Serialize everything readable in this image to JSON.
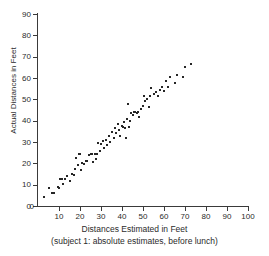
{
  "chart_data": {
    "type": "scatter",
    "title": "",
    "xlabel": "Distances Estimated in Feet",
    "xlabel_sub": "(subject 1: absolute estimates, before lunch)",
    "ylabel": "Actual Distances in Feet",
    "xlim": [
      0,
      100
    ],
    "ylim": [
      0,
      90
    ],
    "xticks": [
      0,
      10,
      20,
      30,
      40,
      50,
      60,
      70,
      80,
      90,
      100
    ],
    "yticks": [
      0,
      10,
      20,
      30,
      40,
      50,
      60,
      70,
      80,
      90
    ],
    "grid": false,
    "legend": null,
    "marker": "square-dot",
    "marker_color": "#262626",
    "axis_color": "#3a3a3a",
    "background": "#ffffff",
    "n_points": 85,
    "points": [
      [
        3.0,
        4.0
      ],
      [
        5.0,
        8.5
      ],
      [
        6.5,
        6.0
      ],
      [
        7.5,
        6.0
      ],
      [
        9.5,
        9.0
      ],
      [
        10.0,
        8.5
      ],
      [
        10.5,
        12.5
      ],
      [
        11.5,
        12.5
      ],
      [
        12.0,
        10.5
      ],
      [
        13.0,
        12.5
      ],
      [
        14.0,
        14.0
      ],
      [
        15.0,
        11.5
      ],
      [
        16.0,
        15.0
      ],
      [
        17.0,
        14.5
      ],
      [
        17.5,
        17.5
      ],
      [
        18.0,
        22.5
      ],
      [
        19.0,
        19.0
      ],
      [
        19.5,
        24.5
      ],
      [
        20.0,
        24.5
      ],
      [
        20.5,
        17.0
      ],
      [
        21.0,
        20.0
      ],
      [
        22.0,
        19.5
      ],
      [
        23.0,
        21.0
      ],
      [
        23.5,
        21.0
      ],
      [
        24.5,
        24.0
      ],
      [
        25.0,
        24.5
      ],
      [
        25.5,
        24.5
      ],
      [
        26.0,
        20.5
      ],
      [
        27.0,
        24.5
      ],
      [
        27.5,
        22.0
      ],
      [
        28.0,
        24.5
      ],
      [
        28.5,
        29.5
      ],
      [
        29.5,
        26.0
      ],
      [
        30.0,
        29.0
      ],
      [
        31.0,
        30.5
      ],
      [
        31.5,
        27.0
      ],
      [
        32.5,
        31.0
      ],
      [
        33.0,
        28.5
      ],
      [
        34.0,
        33.0
      ],
      [
        34.5,
        30.0
      ],
      [
        35.0,
        34.5
      ],
      [
        36.0,
        32.0
      ],
      [
        36.5,
        36.5
      ],
      [
        37.0,
        34.0
      ],
      [
        38.0,
        38.5
      ],
      [
        38.5,
        35.5
      ],
      [
        39.0,
        33.0
      ],
      [
        40.0,
        37.5
      ],
      [
        40.5,
        37.0
      ],
      [
        41.0,
        39.5
      ],
      [
        41.5,
        36.5
      ],
      [
        42.0,
        32.0
      ],
      [
        42.5,
        41.0
      ],
      [
        43.0,
        48.0
      ],
      [
        43.5,
        37.0
      ],
      [
        44.0,
        40.0
      ],
      [
        44.5,
        43.5
      ],
      [
        45.0,
        42.5
      ],
      [
        45.5,
        44.0
      ],
      [
        46.0,
        44.0
      ],
      [
        47.0,
        43.5
      ],
      [
        47.5,
        44.0
      ],
      [
        48.0,
        41.5
      ],
      [
        49.0,
        45.5
      ],
      [
        50.0,
        47.0
      ],
      [
        50.5,
        51.5
      ],
      [
        51.0,
        49.0
      ],
      [
        52.0,
        50.0
      ],
      [
        53.0,
        46.5
      ],
      [
        53.5,
        51.5
      ],
      [
        54.0,
        55.5
      ],
      [
        55.0,
        52.5
      ],
      [
        56.0,
        53.5
      ],
      [
        57.0,
        51.5
      ],
      [
        58.0,
        54.5
      ],
      [
        59.0,
        56.0
      ],
      [
        60.0,
        54.0
      ],
      [
        61.0,
        58.5
      ],
      [
        62.0,
        56.0
      ],
      [
        63.0,
        60.5
      ],
      [
        65.0,
        57.5
      ],
      [
        66.0,
        61.5
      ],
      [
        69.0,
        60.5
      ],
      [
        70.0,
        65.0
      ],
      [
        73.0,
        66.5
      ]
    ]
  }
}
